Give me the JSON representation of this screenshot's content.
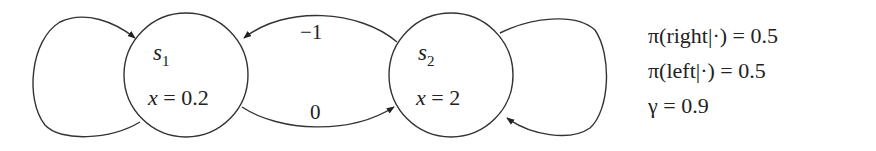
{
  "diagram": {
    "type": "markov-reward-process",
    "states": [
      {
        "id": "s1",
        "name": "s",
        "subscript": "1",
        "value_var": "x",
        "value_eq": "=",
        "value": "0.2"
      },
      {
        "id": "s2",
        "name": "s",
        "subscript": "2",
        "value_var": "x",
        "value_eq": "=",
        "value": "2"
      }
    ],
    "edges": [
      {
        "from": "s1",
        "to": "s1",
        "kind": "self-loop",
        "label": ""
      },
      {
        "from": "s2",
        "to": "s1",
        "kind": "transition",
        "label": "−1"
      },
      {
        "from": "s1",
        "to": "s2",
        "kind": "transition",
        "label": "0"
      },
      {
        "from": "s2",
        "to": "s2",
        "kind": "self-loop",
        "label": ""
      }
    ],
    "parameters": [
      {
        "text": "π(right|·) = 0.5"
      },
      {
        "text": "π(left|·) = 0.5"
      },
      {
        "text": "γ = 0.9"
      }
    ],
    "colors": {
      "stroke": "#333333",
      "text": "#222222",
      "background": "#ffffff"
    }
  }
}
